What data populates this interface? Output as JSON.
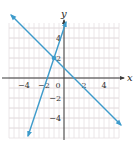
{
  "chart_data": {
    "type": "line",
    "title": "",
    "xlabel": "x",
    "ylabel": "y",
    "xlim": [
      -5.7,
      5.6
    ],
    "ylim": [
      -6.0,
      5.8
    ],
    "grid": true,
    "x_ticks": [
      -4,
      -2,
      0,
      2,
      4
    ],
    "x_tick_labels": [
      "−4",
      "−2",
      "0",
      "2",
      "4"
    ],
    "y_ticks": [
      4,
      2,
      -2,
      -4
    ],
    "y_tick_labels": [
      "4",
      "2",
      "−2",
      "−4"
    ],
    "series": [
      {
        "name": "y = 3x + 5",
        "equation": {
          "slope": 3,
          "intercept": 5
        },
        "x_range": [
          -3.6,
          0.2
        ],
        "color": "#3d9bcb",
        "arrows": "both"
      },
      {
        "name": "y = -x + 1",
        "equation": {
          "slope": -1,
          "intercept": 1
        },
        "x_range": [
          -5.3,
          5.7
        ],
        "color": "#3d9bcb",
        "arrows": "both"
      }
    ],
    "points": [
      {
        "label": "intersection",
        "x": -1,
        "y": 2,
        "color": "#3d9bcb"
      }
    ]
  },
  "colors": {
    "axis": "#3b3b3b",
    "grid": "#e6dfe2",
    "line": "#3d9bcb"
  }
}
